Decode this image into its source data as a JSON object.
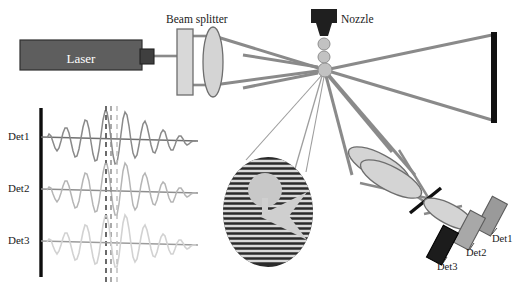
{
  "diagram": {
    "labels": {
      "laser": "Laser",
      "beam_splitter": "Beam splitter",
      "nozzle": "Nozzle",
      "trace_det1": "Det1",
      "trace_det2": "Det2",
      "trace_det3": "Det3",
      "detector1": "Det1",
      "detector2": "Det2",
      "detector3": "Det3"
    },
    "colors": {
      "laser_body": "#5e5e5e",
      "laser_head": "#4a4a4a",
      "beam": "#808080",
      "lens_fill": "#d4d4d4",
      "lens_stroke": "#6e6e6e",
      "beam_splitter_fill": "#d8d8d8",
      "beam_dump": "#111111",
      "nozzle": "#1f1f1f",
      "droplet": "#c2c2c2",
      "axis": "#0d0d0d",
      "trace_det1": "#8a8a8a",
      "trace_det2": "#b5b5b5",
      "trace_det3": "#d2d2d2",
      "dash_det1": "#3a3a3a",
      "dash_det2": "#8f8f8f",
      "dash_det3": "#c0c0c0",
      "detector1_fill": "#9a9a9a",
      "detector2_fill": "#a8a8a8",
      "detector3_fill": "#1c1c1c",
      "fringe_dark": "#2a2a2a",
      "fringe_light": "#d9d9d9",
      "mask": "#111111",
      "text": "#1a1a1a"
    },
    "components": {
      "laser_box": {
        "x": 20,
        "y": 40,
        "w": 122,
        "h": 30
      },
      "laser_head": {
        "x": 140,
        "y": 49,
        "w": 14,
        "h": 14
      },
      "beam_splitter": {
        "x": 177,
        "y": 29,
        "w": 16,
        "h": 66
      },
      "collimator_lens": {
        "cx": 213,
        "cy": 62,
        "rx": 10,
        "ry": 35
      },
      "beam_dump": {
        "x": 491,
        "y": 32,
        "w": 6,
        "h": 91
      },
      "nozzle_body": {
        "x": 312,
        "y": 10,
        "w": 25,
        "h": 14
      },
      "probe_volume": {
        "cx": 324,
        "cy": 70,
        "r": 7
      },
      "droplets": [
        {
          "cx": 324,
          "cy": 44,
          "r": 6
        },
        {
          "cx": 324,
          "cy": 57,
          "r": 6
        }
      ],
      "collection_lens_1": {
        "cx": 379,
        "cy": 166,
        "rx": 34,
        "ry": 12,
        "rot": 28
      },
      "collection_lens_2": {
        "cx": 390,
        "cy": 178,
        "rx": 34,
        "ry": 12,
        "rot": 28
      },
      "focusing_lens": {
        "cx": 448,
        "cy": 213,
        "rx": 28,
        "ry": 10,
        "rot": 28
      },
      "spatial_filter": {
        "x1": 409,
        "y1": 213,
        "x2": 440,
        "y2": 188
      },
      "detectors": [
        {
          "name": "Det1",
          "cx": 492,
          "cy": 216
        },
        {
          "name": "Det2",
          "cx": 470,
          "cy": 230
        },
        {
          "name": "Det3",
          "cx": 443,
          "cy": 245
        }
      ]
    },
    "inset": {
      "ellipse": {
        "cx": 268,
        "cy": 212,
        "rx": 45,
        "ry": 55
      },
      "fringe_count": 22,
      "particle": {
        "cx": 265,
        "cy": 190,
        "r": 17
      },
      "arrow_direction": "down"
    },
    "signal_axis": {
      "x": 41,
      "y_top": 108,
      "y_bottom": 276
    },
    "traces": [
      {
        "name": "Det1",
        "baseline_y": 138,
        "phase_shift": 0,
        "color_key": "trace_det1",
        "dash_x": 106
      },
      {
        "name": "Det2",
        "baseline_y": 190,
        "phase_shift": 5.5,
        "color_key": "trace_det2",
        "dash_x": 111
      },
      {
        "name": "Det3",
        "baseline_y": 242,
        "phase_shift": 11,
        "color_key": "trace_det3",
        "dash_x": 117
      }
    ],
    "trace_params": {
      "x_start": 47,
      "x_end": 196,
      "amplitude": 26,
      "wavelength": 17,
      "envelope_center": 112,
      "envelope_width": 38
    }
  }
}
